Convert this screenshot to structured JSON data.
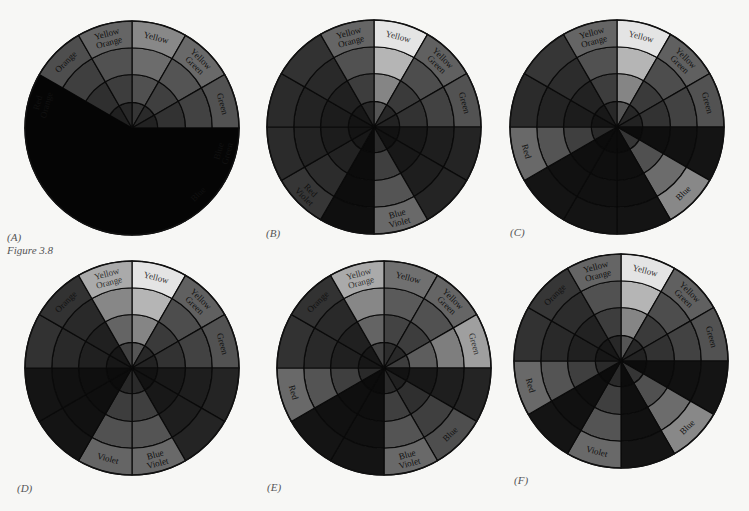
{
  "figure": {
    "caption": "Figure 3.8",
    "hues": [
      "Yellow",
      "Yellow Green",
      "Green",
      "Blue Green",
      "Blue",
      "Blue Violet",
      "Violet",
      "Red Violet",
      "Red",
      "Red Orange",
      "Orange",
      "Yellow Orange"
    ],
    "rings": 4,
    "colors": {
      "background": "#f7f7f5",
      "light": "#f2f2ee",
      "midlight": "#a8a8a6",
      "mid": "#6e6e6e",
      "middark": "#4a4a4a",
      "dark": "#333333",
      "darker": "#232323",
      "black": "#050505",
      "line": "#0a0a0a"
    },
    "panels": [
      {
        "id": "A",
        "label": "(A)",
        "cx": 132,
        "cy": 128,
        "r": 107,
        "outer_values": [
          0.55,
          0.42,
          0.32,
          0.45,
          0.18,
          0.03,
          0.03,
          0.03,
          0.03,
          0.45,
          0.3,
          0.4
        ],
        "black_wedge": {
          "start": 90,
          "end": 300
        },
        "labels": [
          "Yellow",
          "Yellow Green",
          "Green",
          "Blue Green",
          "Blue",
          "",
          "",
          "",
          "",
          "Red Orange",
          "Orange",
          "Yellow Orange"
        ]
      },
      {
        "id": "B",
        "label": "(B)",
        "cx": 374,
        "cy": 127,
        "r": 107,
        "outer_values": [
          0.95,
          0.38,
          0.32,
          0.12,
          0.12,
          0.42,
          0.03,
          0.2,
          0.15,
          0.15,
          0.18,
          0.4
        ],
        "black_wedge": null,
        "labels": [
          "Yellow",
          "Yellow Green",
          "Green",
          "",
          "",
          "Blue Violet",
          "",
          "Red Violet",
          "",
          "",
          "",
          "Yellow Orange"
        ]
      },
      {
        "id": "C",
        "label": "(C)",
        "cx": 617,
        "cy": 127,
        "r": 107,
        "outer_values": [
          0.95,
          0.38,
          0.32,
          0.05,
          0.55,
          0.05,
          0.05,
          0.05,
          0.42,
          0.15,
          0.2,
          0.4
        ],
        "black_wedge": null,
        "labels": [
          "Yellow",
          "Yellow Green",
          "Green",
          "",
          "Blue",
          "",
          "",
          "",
          "Red",
          "",
          "",
          "Yellow Orange"
        ]
      },
      {
        "id": "D",
        "label": "(D)",
        "cx": 132,
        "cy": 368,
        "r": 107,
        "outer_values": [
          0.95,
          0.38,
          0.32,
          0.12,
          0.12,
          0.42,
          0.4,
          0.05,
          0.05,
          0.18,
          0.18,
          0.7
        ],
        "black_wedge": null,
        "labels": [
          "Yellow",
          "Yellow Green",
          "Green",
          "",
          "",
          "Blue Violet",
          "Violet",
          "",
          "",
          "",
          "Orange",
          "Yellow Orange"
        ]
      },
      {
        "id": "E",
        "label": "(E)",
        "cx": 384,
        "cy": 368,
        "r": 107,
        "outer_values": [
          0.45,
          0.4,
          0.65,
          0.12,
          0.3,
          0.42,
          0.05,
          0.05,
          0.42,
          0.18,
          0.18,
          0.7
        ],
        "black_wedge": null,
        "labels": [
          "Yellow",
          "Yellow Green",
          "Green",
          "",
          "Blue",
          "Blue Violet",
          "",
          "",
          "Red",
          "",
          "Orange",
          "Yellow Orange"
        ]
      },
      {
        "id": "F",
        "label": "(F)",
        "cx": 621,
        "cy": 361,
        "r": 107,
        "outer_values": [
          0.95,
          0.38,
          0.32,
          0.05,
          0.55,
          0.05,
          0.42,
          0.05,
          0.42,
          0.18,
          0.2,
          0.4
        ],
        "black_wedge": null,
        "labels": [
          "Yellow",
          "Yellow Green",
          "Green",
          "",
          "Blue",
          "",
          "Violet",
          "",
          "Red",
          "",
          "Orange",
          "Yellow Orange"
        ]
      }
    ]
  }
}
